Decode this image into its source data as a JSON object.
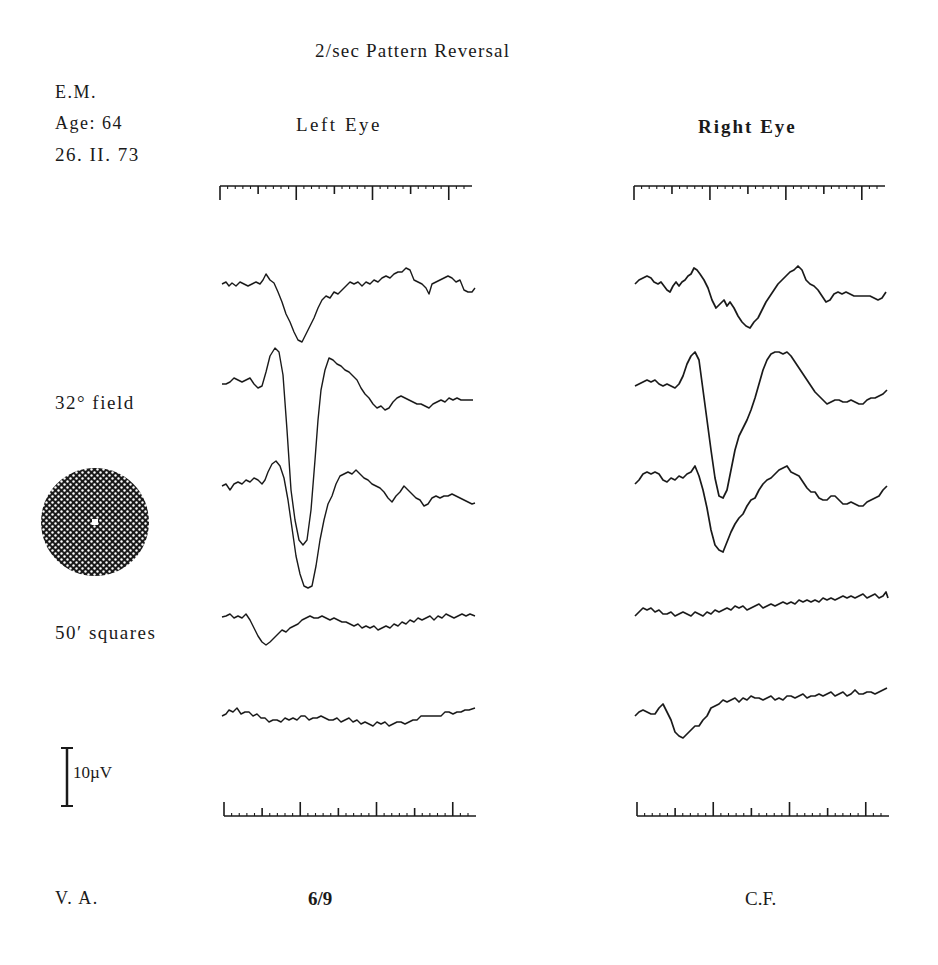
{
  "header": {
    "title": "2/sec Pattern Reversal",
    "patient_initials": "E.M.",
    "age": "Age: 64",
    "date": "26. II. 73"
  },
  "columns": {
    "left": {
      "label": "Left Eye",
      "visual_acuity": "6/9"
    },
    "right": {
      "label": "Right Eye",
      "visual_acuity": "C.F."
    }
  },
  "stimulus": {
    "field_label": "32° field",
    "check_label": "50′ squares",
    "icon": "checkerboard-disc-icon"
  },
  "scale_bar": {
    "label": "10µV"
  },
  "footer": {
    "va_label": "V. A."
  },
  "colors": {
    "ink": "#1a1a1a",
    "background": "#ffffff"
  },
  "chart_data": [
    {
      "type": "line",
      "title": "Left Eye — pattern-reversal VEP traces (2/sec, 32° field, 50′ squares)",
      "xlabel": "time (timebase ticks, major every 5 minor)",
      "ylabel": "amplitude (scale bar = 10µV)",
      "grid": false,
      "time_marks": {
        "minor_ticks": 32,
        "major_every": 5
      },
      "series": [
        {
          "name": "trace 1",
          "baseline_px": 285,
          "feature": "negative trough ~12µV at ~0.25 of sweep"
        },
        {
          "name": "trace 2",
          "baseline_px": 383,
          "feature": "positive peak then large trough ~38µV at ~0.27 of sweep"
        },
        {
          "name": "trace 3",
          "baseline_px": 483,
          "feature": "positive peak then large trough ~25µV at ~0.28 of sweep"
        },
        {
          "name": "trace 4",
          "baseline_px": 617,
          "feature": "small trough ~6µV at ~0.18 of sweep"
        },
        {
          "name": "trace 5",
          "baseline_px": 715,
          "feature": "flat, slight sag mid-sweep"
        }
      ],
      "visual_acuity": "6/9"
    },
    {
      "type": "line",
      "title": "Right Eye — pattern-reversal VEP traces (2/sec, 32° field, 50′ squares)",
      "xlabel": "time (timebase ticks, major every 5 minor)",
      "ylabel": "amplitude (scale bar = 10µV)",
      "grid": false,
      "time_marks": {
        "minor_ticks": 32,
        "major_every": 5
      },
      "series": [
        {
          "name": "trace 1",
          "baseline_px": 283,
          "feature": "broad trough ~10µV at ~0.45 of sweep"
        },
        {
          "name": "trace 2",
          "baseline_px": 383,
          "feature": "sharp peak then trough ~28µV at ~0.34 of sweep"
        },
        {
          "name": "trace 3",
          "baseline_px": 484,
          "feature": "trough ~15µV at ~0.35 of sweep"
        },
        {
          "name": "trace 4",
          "baseline_px": 612,
          "feature": "flat, slow upward drift"
        },
        {
          "name": "trace 5",
          "baseline_px": 712,
          "feature": "early trough ~6µV at ~0.19 of sweep, then flat"
        }
      ],
      "visual_acuity": "C.F."
    }
  ],
  "traces": {
    "left": [
      "222,284 226,282 229,286 232,283 236,286 240,282 244,284 248,286 252,284 256,282 260,284 263,280 266,274 270,280 274,283 278,292 282,302 286,314 290,322 294,332 298,340 302,342 306,334 310,326 314,318 318,308 322,300 326,296 330,298 334,292 338,294 342,290 346,286 350,282 354,284 358,282 362,286 366,282 370,284 374,280 378,282 382,278 386,276 390,278 394,274 398,272 402,272 406,268 410,270 414,280 418,282 422,284 426,288 429,294 432,284 436,282 440,280 444,278 448,276 452,278 456,282 460,280 464,290 468,292 472,292 475,288",
      "222,384 226,384 230,382 234,378 238,380 242,382 246,380 250,378 254,384 258,388 262,386 266,372 270,356 275,348 279,352 283,375 287,430 291,490 295,520 299,540 303,545 307,540 311,510 315,460 318,420 321,390 325,370 329,358 333,360 337,364 341,366 345,370 349,372 353,376 357,380 361,388 365,394 369,398 373,404 377,408 381,406 385,410 389,408 393,402 397,398 401,396 405,398 409,400 413,402 417,404 421,404 425,406 429,408 433,404 437,402 441,400 445,402 449,398 453,400 457,398 461,400 465,400 469,400 473,400",
      "222,486 226,484 230,490 234,484 238,482 242,484 246,480 250,482 254,478 258,480 262,484 265,480 268,472 272,464 276,461 280,466 284,478 288,500 292,528 296,556 300,574 304,586 308,588 312,586 316,566 320,540 324,520 328,504 332,496 336,484 340,476 344,474 348,472 352,474 356,470 360,474 364,478 368,480 372,484 376,486 380,488 384,492 388,498 392,502 396,496 400,492 404,486 408,490 412,494 416,498 420,500 424,506 428,504 432,498 436,496 440,498 444,496 448,496 452,494 456,496 460,498 464,500 468,502 472,504 475,503",
      "222,617 226,616 230,614 234,618 238,616 242,618 246,614 250,620 254,628 258,636 262,642 266,645 270,642 274,638 278,634 282,630 286,632 290,628 294,626 298,624 302,620 306,618 310,616 314,618 318,618 322,616 326,618 330,620 334,618 338,620 342,622 346,622 350,624 354,626 358,624 362,628 366,626 370,628 374,626 378,630 382,628 386,626 390,628 394,624 398,626 402,622 406,624 410,620 414,622 418,618 422,620 426,618 430,616 434,620 438,616 442,618 446,614 450,616 454,618 458,616 462,614 466,616 470,614 475,616",
      "222,716 226,714 229,710 233,712 237,708 241,714 245,712 249,712 253,716 257,714 261,718 265,718 269,722 273,720 277,720 281,722 285,718 289,720 293,718 297,720 301,716 305,716 309,720 313,718 317,718 321,716 325,718 329,720 333,720 337,718 341,722 345,720 349,718 353,722 357,720 361,724 365,722 369,724 373,726 377,722 381,724 385,722 389,726 393,724 397,722 401,722 405,724 409,722 413,720 417,720 421,716 425,716 429,716 433,716 437,716 441,716 445,712 449,712 453,714 457,712 461,712 465,710 469,710 475,708",
      ""
    ],
    "right": [
      "635,284 639,280 643,278 647,276 651,278 654,282 658,284 661,282 664,286 667,290 670,292 673,286 676,282 679,286 682,282 685,280 688,276 691,274 694,268 697,270 700,274 704,280 708,288 712,300 716,308 720,304 724,300 727,306 730,302 734,308 738,316 742,322 746,326 750,328 754,322 758,318 762,310 766,302 770,296 774,290 778,284 782,280 786,276 790,272 794,270 798,266 802,270 806,280 810,284 814,286 818,290 822,296 826,302 830,300 834,294 838,292 842,294 846,292 850,294 854,296 858,296 862,296 866,296 870,296 874,298 878,300 882,298 886,292",
      "635,386 639,384 643,382 647,380 651,382 655,380 659,384 663,386 667,384 671,386 675,388 679,384 683,376 687,364 691,356 695,352 699,360 703,390 707,420 711,450 715,478 719,496 723,498 727,490 731,470 735,450 739,436 743,428 747,420 751,410 755,398 759,384 763,370 767,360 771,354 775,352 779,352 783,354 787,352 791,356 795,362 799,368 803,374 807,380 811,386 815,392 819,396 823,400 827,404 831,402 835,400 839,400 843,402 847,402 851,400 855,402 859,404 863,404 867,400 871,398 875,398 879,396 883,394 887,390",
      "635,484 639,480 643,474 647,472 651,474 655,472 659,474 663,480 667,482 671,478 675,480 679,476 683,478 687,474 691,472 695,466 699,476 703,490 707,508 711,530 715,545 719,550 723,552 727,542 731,532 735,524 739,518 743,514 747,506 751,500 755,498 759,490 763,484 767,480 771,478 775,474 779,470 783,468 787,466 791,472 795,474 799,476 803,482 807,488 811,492 815,492 819,498 823,500 827,500 831,496 835,496 839,500 843,504 847,504 851,502 855,504 859,506 863,506 867,502 871,500 875,498 879,496 883,490 887,486",
      "635,616 639,612 643,608 647,610 651,608 655,612 659,610 663,614 667,614 671,612 675,616 679,614 683,612 687,614 691,616 695,612 699,614 703,616 707,612 711,614 715,610 719,612 723,610 727,608 731,610 735,606 739,608 743,606 747,610 751,608 755,606 759,604 763,608 767,606 771,604 775,606 779,604 783,602 787,604 791,602 795,604 799,600 803,602 807,600 811,602 815,600 819,602 823,598 827,600 831,598 835,600 839,598 843,596 847,598 851,596 855,598 859,596 863,594 867,598 871,596 875,594 879,598 883,596 886,592 888,598",
      "635,716 639,712 643,710 647,712 651,714 655,714 659,708 663,704 667,712 671,720 675,732 679,736 683,738 687,734 691,730 695,726 699,726 703,720 707,716 711,708 715,706 719,704 723,700 727,702 731,700 735,698 739,702 743,698 747,700 751,696 755,698 759,698 763,700 767,698 771,696 775,700 779,698 783,700 787,696 791,696 795,698 799,696 803,694 807,698 811,696 815,696 819,694 823,696 827,694 831,692 835,696 839,694 843,692 847,696 851,694 855,690 859,694 863,694 867,692 871,692 875,694 879,692 883,690 887,688",
      ""
    ]
  }
}
